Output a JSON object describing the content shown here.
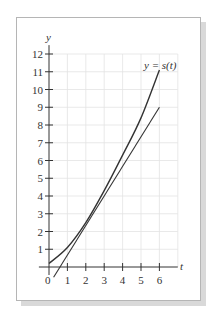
{
  "chart_data": {
    "type": "line",
    "title": "",
    "xlabel": "t",
    "ylabel": "y",
    "xlim": [
      0,
      7
    ],
    "ylim": [
      0,
      12
    ],
    "grid": true,
    "legend": null,
    "x_ticks": [
      "0",
      "1",
      "2",
      "3",
      "4",
      "5",
      "6"
    ],
    "y_ticks": [
      "1",
      "2",
      "3",
      "4",
      "5",
      "6",
      "7",
      "8",
      "9",
      "10",
      "11",
      "12"
    ],
    "series": [
      {
        "name": "y = s(t)",
        "style": "curve",
        "x": [
          0,
          1,
          2,
          3,
          4,
          5,
          6
        ],
        "values": [
          0.2,
          1.1,
          2.5,
          4.3,
          6.3,
          8.4,
          11.1
        ]
      },
      {
        "name": "tangent line",
        "style": "straight",
        "x": [
          0.25,
          6
        ],
        "values": [
          -0.58,
          9
        ]
      }
    ],
    "annotations": [
      {
        "text": "y = s(t)",
        "x": 5.5,
        "y": 11.3
      }
    ]
  },
  "labels": {
    "y_axis": "y",
    "x_axis": "t",
    "origin": "0",
    "curve_label": "y = s(t)"
  },
  "colors": {
    "ink": "#333333",
    "grid": "#e3e3e3",
    "frame": "#bdbdbd",
    "shadow": "#d6d6d6"
  }
}
